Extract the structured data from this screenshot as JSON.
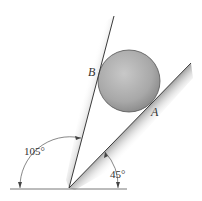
{
  "diagram": {
    "labels": {
      "point_b": "B",
      "point_a": "A",
      "angle_wall": "105°",
      "angle_incline": "45°"
    },
    "colors": {
      "line": "#3a3a3a",
      "ball_light": "#c4c4c4",
      "ball_dark": "#8e8e8e",
      "shading": "#b8b8b8"
    }
  }
}
